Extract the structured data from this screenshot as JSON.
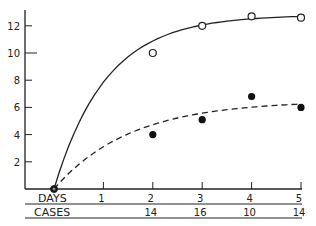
{
  "chart_data": {
    "type": "line",
    "title": "",
    "xlabel": "DAYS",
    "ylabel": "",
    "x": [
      0,
      1,
      2,
      3,
      4,
      5
    ],
    "x_ticks": [
      "1",
      "2",
      "3",
      "4",
      "5"
    ],
    "y_ticks": [
      "2",
      "4",
      "6",
      "8",
      "10",
      "12"
    ],
    "ylim": [
      0,
      13
    ],
    "xlim": [
      0,
      5
    ],
    "grid": false,
    "series": [
      {
        "name": "solid-curve-open-circles",
        "style": "solid",
        "marker": "open-circle",
        "points": [
          [
            0,
            0
          ],
          [
            2,
            10
          ],
          [
            3,
            12
          ],
          [
            4,
            12.7
          ],
          [
            5,
            12.6
          ]
        ]
      },
      {
        "name": "dashed-curve-filled-dots",
        "style": "dashed",
        "marker": "filled-circle",
        "points": [
          [
            0,
            0
          ],
          [
            2,
            4
          ],
          [
            3,
            5.1
          ],
          [
            4,
            6.8
          ],
          [
            5,
            6
          ]
        ]
      }
    ],
    "table": {
      "row_labels": [
        "DAYS",
        "CASES"
      ],
      "days": [
        "1",
        "2",
        "3",
        "4",
        "5"
      ],
      "cases": [
        "",
        "14",
        "16",
        "10",
        "14"
      ]
    }
  },
  "labels": {
    "days": "DAYS",
    "cases": "CASES"
  }
}
